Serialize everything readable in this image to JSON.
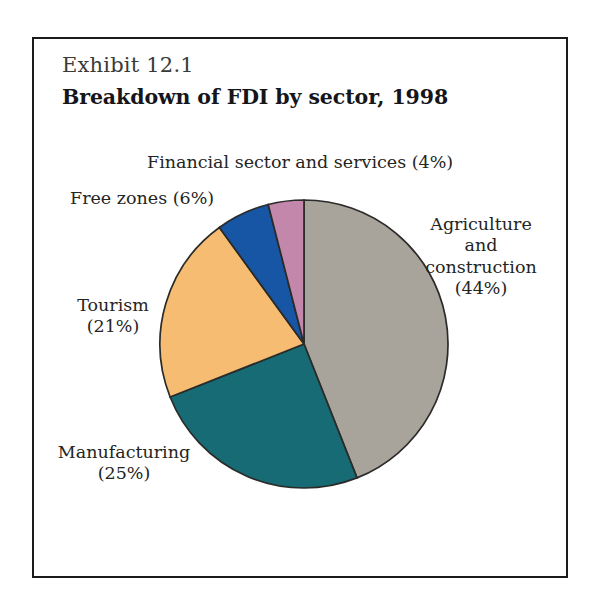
{
  "figure": {
    "exhibit_number": "Exhibit 12.1",
    "title": "Breakdown of FDI by sector, 1998"
  },
  "labels": {
    "financial": "Financial sector and services (4%)",
    "free_zones": "Free zones (6%)",
    "tourism": "Tourism\n(21%)",
    "manufacturing": "Manufacturing\n(25%)",
    "agriculture": "Agriculture\nand\nconstruction\n(44%)"
  },
  "chart_data": {
    "type": "pie",
    "title": "Breakdown of FDI by sector, 1998",
    "subtitle": "Exhibit 12.1",
    "unit": "percent",
    "start_angle_deg": 0,
    "direction": "clockwise",
    "legend": "none (direct labels)",
    "categories": [
      "Agriculture and construction",
      "Manufacturing",
      "Tourism",
      "Free zones",
      "Financial sector and services"
    ],
    "values": [
      44,
      25,
      21,
      6,
      4
    ],
    "colors": [
      "#a9a49b",
      "#166b75",
      "#f5bc72",
      "#1656a4",
      "#c287ab"
    ],
    "slices": [
      {
        "label": "Agriculture and construction",
        "value": 44,
        "color": "#a9a49b",
        "start_deg": 0,
        "end_deg": 158.4
      },
      {
        "label": "Manufacturing",
        "value": 25,
        "color": "#166b75",
        "start_deg": 158.4,
        "end_deg": 248.4
      },
      {
        "label": "Tourism",
        "value": 21,
        "color": "#f5bc72",
        "start_deg": 248.4,
        "end_deg": 324.0
      },
      {
        "label": "Free zones",
        "value": 6,
        "color": "#1656a4",
        "start_deg": 324.0,
        "end_deg": 345.6
      },
      {
        "label": "Financial sector and services",
        "value": 4,
        "color": "#c287ab",
        "start_deg": 345.6,
        "end_deg": 360.0
      }
    ]
  },
  "style": {
    "frame_border": "#1a1a18",
    "background": "#ffffff",
    "text": "#242422",
    "slice_outline": "#2b2b29"
  }
}
